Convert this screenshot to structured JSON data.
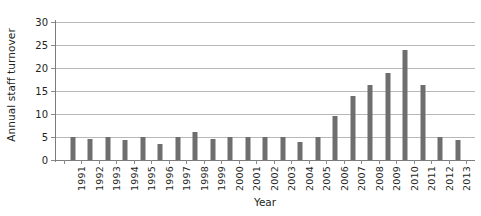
{
  "chart_data": {
    "type": "bar",
    "title": "",
    "xlabel": "Year",
    "ylabel": "Annual staff turnover",
    "categories": [
      "1991",
      "1992",
      "1993",
      "1994",
      "1995",
      "1996",
      "1997",
      "1998",
      "1999",
      "2000",
      "2001",
      "2002",
      "2003",
      "2004",
      "2005",
      "2006",
      "2007",
      "2008",
      "2009",
      "2010",
      "2011",
      "2012",
      "2013"
    ],
    "values": [
      5,
      4.5,
      5,
      4.4,
      5,
      3.5,
      5,
      6,
      4.5,
      5,
      5,
      5,
      5,
      4,
      5,
      9.5,
      14,
      16.3,
      19,
      24,
      16.3,
      5,
      4.3
    ],
    "series": [
      {
        "name": "Annual staff turnover",
        "values": [
          5,
          4.5,
          5,
          4.4,
          5,
          3.5,
          5,
          6,
          4.5,
          5,
          5,
          5,
          5,
          4,
          5,
          9.5,
          14,
          16.3,
          19,
          24,
          16.3,
          5,
          4.3
        ]
      }
    ],
    "ylim": [
      0,
      30
    ],
    "y_ticks": [
      0,
      5,
      10,
      15,
      20,
      25,
      30
    ],
    "y_tick_labels": [
      "0",
      "5",
      "10",
      "15",
      "20",
      "25",
      "30"
    ],
    "grid": true,
    "legend": "none",
    "bar_color": "#6e6e6e",
    "gridline_color": "#b8b8b8",
    "axis_color": "#7c7c7c",
    "background_color": "#ffffff",
    "text_color": "#231f20"
  }
}
